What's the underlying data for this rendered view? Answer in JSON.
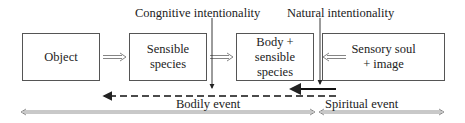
{
  "diagram": {
    "top_labels": {
      "cognitive": "Congnitive intentionality",
      "natural": "Natural intentionality"
    },
    "boxes": [
      {
        "id": "object",
        "text": "Object"
      },
      {
        "id": "sensible-species",
        "text": "Sensible species"
      },
      {
        "id": "body-sensible-species",
        "line1": "Body + sensible",
        "line2": "species"
      },
      {
        "id": "sensory-soul-image",
        "line1": "Sensory soul",
        "line2": "+ image"
      }
    ],
    "bottom_labels": {
      "bodily": "Bodily event",
      "spiritual": "Spiritual event"
    },
    "colors": {
      "line": "#222222",
      "box_border": "#555555",
      "outline_arrow": "#666666"
    }
  }
}
